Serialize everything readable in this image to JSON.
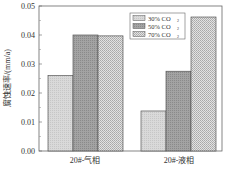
{
  "chart_data": {
    "type": "bar",
    "title": "",
    "xlabel": "",
    "ylabel": "腐蚀速率/(mm/a)",
    "ylim": [
      0,
      0.05
    ],
    "yticks": [
      "0.00",
      "0.01",
      "0.02",
      "0.03",
      "0.04",
      "0.05"
    ],
    "categories": [
      "20#-气相",
      "20#-液相"
    ],
    "series": [
      {
        "name": "30% CO2",
        "values": [
          0.026,
          0.0138
        ],
        "color": "#d4d4d4"
      },
      {
        "name": "50% CO2",
        "values": [
          0.04,
          0.0275
        ],
        "color": "#9c9c9c"
      },
      {
        "name": "70% CO2",
        "values": [
          0.0397,
          0.0462
        ],
        "color": "#c8c8c8"
      }
    ],
    "legend": {
      "position": "upper-right-inside",
      "entries": [
        "30%  CO",
        "50%  CO",
        "70%  CO"
      ],
      "subscript": "2"
    },
    "grid": false
  }
}
